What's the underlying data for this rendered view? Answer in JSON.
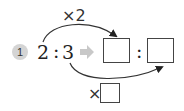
{
  "problem": {
    "number": "1",
    "left_ratio": {
      "a": "2",
      "separator": ":",
      "b": "3"
    },
    "right_ratio": {
      "a": "",
      "separator": ":",
      "b": ""
    },
    "top_multiplier": "×2",
    "bottom_multiplier_symbol": "×",
    "bottom_multiplier_value": ""
  },
  "colors": {
    "badge": "#d4d4d4",
    "arrow": "#c8c8c8",
    "line": "#333333"
  }
}
